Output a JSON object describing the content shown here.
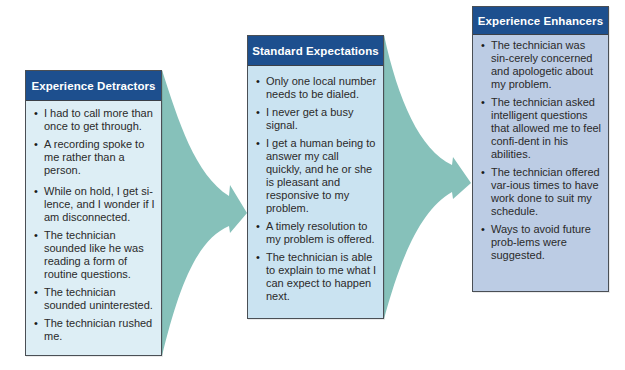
{
  "colors": {
    "header_bg": "#1d4f8e",
    "header_text": "#ffffff",
    "connector": "#86c1ba",
    "detractors_body": "#ddeef5",
    "standard_body": "#cae3f1",
    "enhancers_body": "#bcccE4",
    "border": "#4a4f55"
  },
  "panels": [
    {
      "title": "Experience Detractors",
      "items": [
        "I had to call more than once to get through.",
        "A recording spoke to me rather than a person.",
        "While on hold, I get si-lence, and I wonder if I am disconnected.",
        "The technician sounded like he was reading a form of routine questions.",
        "The technician sounded uninterested.",
        "The technician rushed me."
      ]
    },
    {
      "title": "Standard Expectations",
      "items": [
        "Only one local number needs to be dialed.",
        "I never get a busy signal.",
        "I get a human being to answer my call quickly, and he or she is pleasant and responsive to my problem.",
        "A timely resolution to my problem is offered.",
        "The technician is able to explain to me what I can expect to happen next."
      ]
    },
    {
      "title": "Experience Enhancers",
      "items": [
        "The technician was sin-cerely concerned and apologetic about my problem.",
        "The technician asked intelligent questions that allowed me to feel confi-dent in his abilities.",
        "The technician offered var-ious times to have work done to suit my schedule.",
        "Ways to avoid future prob-lems were suggested."
      ]
    }
  ],
  "bullet_glyph": "•"
}
